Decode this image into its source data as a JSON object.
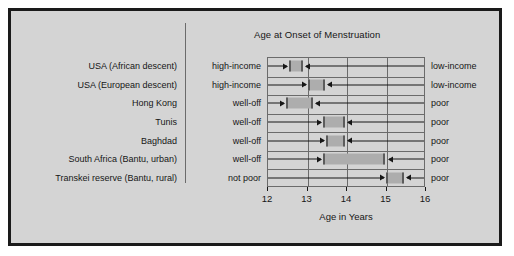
{
  "chart_data": {
    "type": "bar",
    "title": "Age at Onset of Menstruation",
    "xlabel": "Age in Years",
    "ylabel": "",
    "xlim": [
      12,
      16
    ],
    "xticks": [
      "12",
      "13",
      "14",
      "15",
      "16"
    ],
    "grid": true,
    "legend_position": "none",
    "orientation": "horizontal",
    "annotations": {
      "left_group_header": "",
      "right_group_header": "",
      "note": "Each horizontal bar spans the mean age at menarche for the better-off group (left end) to the poorer group (right end); arrows point inward from each side label."
    },
    "categories": [
      "USA (African descent)",
      "USA (European descent)",
      "Hong Kong",
      "Tunis",
      "Baghdad",
      "South Africa (Bantu, urban)",
      "Transkei reserve (Bantu, rural)"
    ],
    "left_labels": [
      "high-income",
      "high-income",
      "well-off",
      "well-off",
      "well-off",
      "well-off",
      "not poor"
    ],
    "right_labels": [
      "low-income",
      "low-income",
      "poor",
      "poor",
      "poor",
      "poor",
      "poor"
    ],
    "rows": [
      {
        "category": "USA (African descent)",
        "left_label": "high-income",
        "right_label": "low-income",
        "start": 12.55,
        "end": 12.92
      },
      {
        "category": "USA (European descent)",
        "left_label": "high-income",
        "right_label": "low-income",
        "start": 13.05,
        "end": 13.48
      },
      {
        "category": "Hong Kong",
        "left_label": "well-off",
        "right_label": "poor",
        "start": 12.48,
        "end": 13.17
      },
      {
        "category": "Tunis",
        "left_label": "well-off",
        "right_label": "poor",
        "start": 13.42,
        "end": 13.98
      },
      {
        "category": "Baghdad",
        "left_label": "well-off",
        "right_label": "poor",
        "start": 13.5,
        "end": 13.98
      },
      {
        "category": "South Africa (Bantu, urban)",
        "left_label": "well-off",
        "right_label": "poor",
        "start": 13.42,
        "end": 15.0
      },
      {
        "category": "Transkei reserve (Bantu, rural)",
        "left_label": "not poor",
        "right_label": "poor",
        "start": 15.02,
        "end": 15.48
      }
    ],
    "colors": {
      "background": "#d4d4d4",
      "frame": "#1a1a1a",
      "bar_fill": "#adadad",
      "bar_cap": "#5c5c5c",
      "grid": "#6b6b6b",
      "text": "#161616"
    }
  }
}
